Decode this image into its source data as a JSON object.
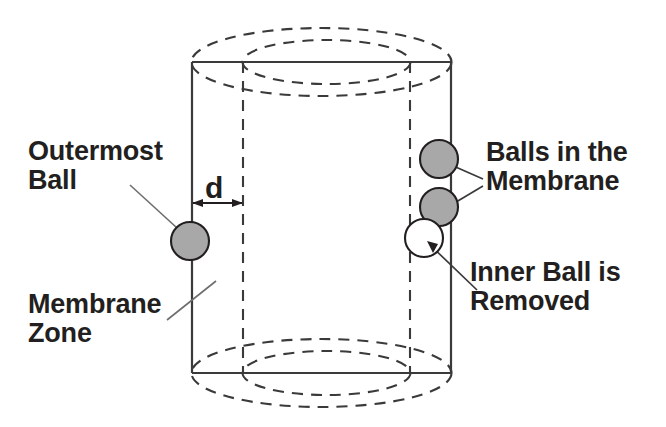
{
  "figure": {
    "type": "technical-diagram",
    "background_color": "#ffffff",
    "line_color": "#3a3a3a",
    "ball_fill_gray": "#a8a8a8",
    "ball_fill_white": "#ffffff",
    "ball_stroke": "#231f20",
    "text_color": "#231f20"
  },
  "labels": {
    "outermost_ball": "Outermost\nBall",
    "membrane_zone": "Membrane\nZone",
    "balls_in_membrane": "Balls in the\nMembrane",
    "inner_ball_removed": "Inner Ball is\nRemoved",
    "dimension_d": "d"
  },
  "geometry": {
    "cylinder": {
      "outer_left_x": 192,
      "outer_right_x": 451,
      "inner_left_x": 243,
      "inner_right_x": 410,
      "top_y": 62,
      "bottom_y": 373,
      "outer_ellipse_rx": 130,
      "outer_ellipse_ry": 34,
      "inner_ellipse_rx": 84,
      "inner_ellipse_ry": 22
    },
    "dimension_arrow": {
      "from_x": 192,
      "to_x": 243,
      "y": 203,
      "label": "d"
    },
    "balls": [
      {
        "name": "outermost-ball",
        "cx": 190,
        "cy": 241,
        "r": 19,
        "fill": "gray"
      },
      {
        "name": "membrane-ball-upper",
        "cx": 439,
        "cy": 159,
        "r": 19,
        "fill": "gray"
      },
      {
        "name": "membrane-ball-lower",
        "cx": 439,
        "cy": 207,
        "r": 19,
        "fill": "gray"
      },
      {
        "name": "inner-ball-removed",
        "cx": 424,
        "cy": 238,
        "r": 19,
        "fill": "white"
      }
    ],
    "leader_lines": [
      {
        "name": "leader-outermost-ball",
        "x1": 130,
        "y1": 185,
        "x2": 188,
        "y2": 238
      },
      {
        "name": "leader-membrane-zone",
        "x1": 167,
        "y1": 320,
        "x2": 215,
        "y2": 283
      },
      {
        "name": "leader-balls-upper",
        "x1": 481,
        "y1": 178,
        "x2": 443,
        "y2": 161
      },
      {
        "name": "leader-balls-lower",
        "x1": 481,
        "y1": 186,
        "x2": 443,
        "y2": 210
      },
      {
        "name": "leader-inner-ball",
        "x1": 475,
        "y1": 288,
        "x2": 427,
        "y2": 241
      }
    ]
  }
}
